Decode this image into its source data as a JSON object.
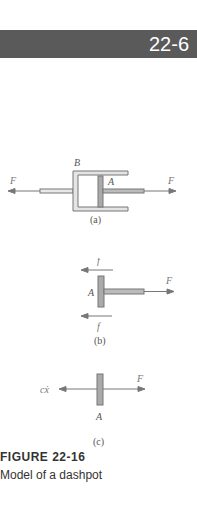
{
  "header": {
    "section_number": "22-6",
    "bar_color": "#5a5a5a"
  },
  "figure": {
    "panels": [
      {
        "id": "a",
        "label": "(a)",
        "labels": {
          "cylinder": "B",
          "piston": "A",
          "force_left": "F",
          "force_right": "F"
        }
      },
      {
        "id": "b",
        "label": "(b)",
        "labels": {
          "piston": "A",
          "friction_top": "f",
          "friction_bottom": "f",
          "force": "F"
        }
      },
      {
        "id": "c",
        "label": "(c)",
        "labels": {
          "piston": "A",
          "damping_force": "cẋ",
          "force": "F"
        }
      }
    ],
    "caption_label": "FIGURE 22-16",
    "caption_text": "Model of a dashpot"
  }
}
